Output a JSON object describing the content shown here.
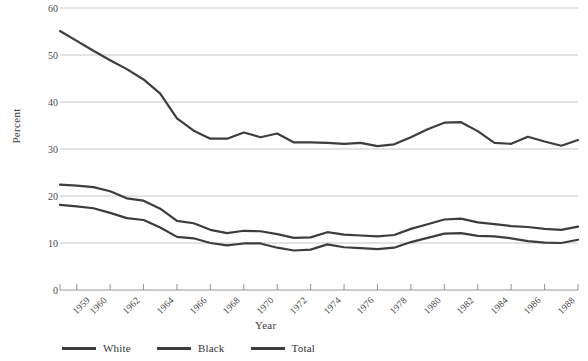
{
  "chart_data": {
    "type": "line",
    "title": "",
    "xlabel": "Year",
    "ylabel": "Percent",
    "ylim": [
      0,
      60
    ],
    "ytick_values": [
      0,
      10,
      20,
      30,
      40,
      50,
      60
    ],
    "xlim": [
      1959,
      1990
    ],
    "xtick_labels": [
      "1959",
      "1960",
      "1962",
      "1964",
      "1966",
      "1968",
      "1970",
      "1972",
      "1974",
      "1976",
      "1978",
      "1980",
      "1982",
      "1984",
      "1986",
      "1988",
      "1990"
    ],
    "grid": "horizontal",
    "legend_position": "bottom-left",
    "x": [
      1959,
      1960,
      1961,
      1962,
      1963,
      1964,
      1965,
      1966,
      1967,
      1968,
      1969,
      1970,
      1971,
      1972,
      1973,
      1974,
      1975,
      1976,
      1977,
      1978,
      1979,
      1980,
      1981,
      1982,
      1983,
      1984,
      1985,
      1986,
      1987,
      1988,
      1989,
      1990
    ],
    "series": [
      {
        "name": "Black",
        "color": "#3d3d3d",
        "values": [
          55.1,
          53.0,
          50.9,
          48.9,
          47.0,
          44.8,
          41.8,
          36.5,
          33.9,
          32.2,
          32.2,
          33.5,
          32.5,
          33.3,
          31.4,
          31.4,
          31.3,
          31.1,
          31.3,
          30.6,
          31.0,
          32.5,
          34.2,
          35.6,
          35.7,
          33.8,
          31.3,
          31.1,
          32.6,
          31.6,
          30.7,
          31.9
        ]
      },
      {
        "name": "Total",
        "color": "#3d3d3d",
        "values": [
          22.4,
          22.2,
          21.9,
          21.0,
          19.5,
          19.0,
          17.3,
          14.7,
          14.2,
          12.8,
          12.1,
          12.6,
          12.5,
          11.9,
          11.1,
          11.2,
          12.3,
          11.8,
          11.6,
          11.4,
          11.7,
          13.0,
          14.0,
          15.0,
          15.2,
          14.4,
          14.0,
          13.6,
          13.4,
          13.0,
          12.8,
          13.5
        ]
      },
      {
        "name": "White",
        "color": "#3d3d3d",
        "values": [
          18.1,
          17.8,
          17.4,
          16.4,
          15.3,
          14.9,
          13.3,
          11.3,
          11.0,
          10.0,
          9.5,
          9.9,
          9.9,
          9.0,
          8.4,
          8.6,
          9.7,
          9.1,
          8.9,
          8.7,
          9.0,
          10.2,
          11.1,
          12.0,
          12.1,
          11.5,
          11.4,
          11.0,
          10.4,
          10.1,
          10.0,
          10.7
        ]
      }
    ]
  },
  "axis": {
    "ylabel": "Percent",
    "xlabel": "Year"
  },
  "legend": {
    "items": [
      {
        "label": "White"
      },
      {
        "label": "Black"
      },
      {
        "label": "Total"
      }
    ]
  }
}
